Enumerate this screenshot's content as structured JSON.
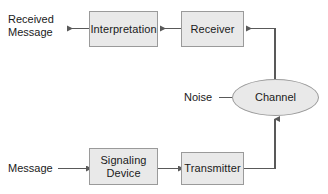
{
  "diagram": {
    "type": "block-flow-diagram",
    "background_color": "#ffffff",
    "node_fill_color": "#e9e9e9",
    "node_border_color": "#9a9a9a",
    "line_color": "#595959",
    "text_color": "#1a1a1a"
  },
  "nodes": [
    {
      "id": "interpretation",
      "label": "Interpretation",
      "shape": "rectangle",
      "x": 89,
      "y": 11,
      "width": 69,
      "height": 36
    },
    {
      "id": "receiver",
      "label": "Receiver",
      "shape": "rectangle",
      "x": 181,
      "y": 11,
      "width": 63,
      "height": 36
    },
    {
      "id": "channel",
      "label": "Channel",
      "shape": "ellipse",
      "x": 232,
      "y": 79,
      "width": 87,
      "height": 37
    },
    {
      "id": "signaling_device",
      "label": "Signaling\nDevice",
      "shape": "rectangle",
      "x": 89,
      "y": 148,
      "width": 69,
      "height": 37
    },
    {
      "id": "transmitter",
      "label": "Transmitter",
      "shape": "rectangle",
      "x": 181,
      "y": 152,
      "width": 63,
      "height": 33
    }
  ],
  "labels": [
    {
      "id": "received_message",
      "text": "Received\nMessage",
      "x": 8,
      "y": 13
    },
    {
      "id": "noise",
      "text": "Noise",
      "x": 184,
      "y": 91
    },
    {
      "id": "message",
      "text": "Message",
      "x": 8,
      "y": 162
    }
  ],
  "edges": [
    {
      "id": "message-to-signaling",
      "from": "message",
      "to": "signaling_device",
      "arrow": true
    },
    {
      "id": "signaling-to-transmitter",
      "from": "signaling_device",
      "to": "transmitter",
      "arrow": true
    },
    {
      "id": "transmitter-to-channel",
      "from": "transmitter",
      "to": "channel",
      "arrow": true
    },
    {
      "id": "noise-to-channel",
      "from": "noise",
      "to": "channel",
      "arrow": true
    },
    {
      "id": "channel-to-receiver",
      "from": "channel",
      "to": "receiver",
      "arrow": true
    },
    {
      "id": "receiver-to-interpretation",
      "from": "receiver",
      "to": "interpretation",
      "arrow": true
    },
    {
      "id": "interpretation-to-received",
      "from": "interpretation",
      "to": "received_message",
      "arrow": true
    }
  ]
}
